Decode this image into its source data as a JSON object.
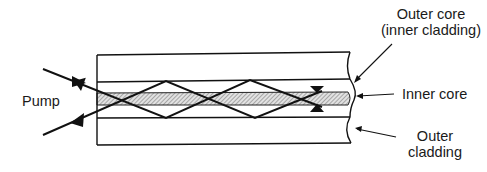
{
  "diagram": {
    "type": "double-clad fiber pumping schematic",
    "labels": {
      "pump": "Pump",
      "outer_core_line1": "Outer core",
      "outer_core_line2": "(inner cladding)",
      "inner_core": "Inner core",
      "outer_cladding_line1": "Outer",
      "outer_cladding_line2": "cladding"
    },
    "colors": {
      "line": "#111111",
      "core_hatch_bg": "#d8d8d8",
      "background": "#ffffff"
    }
  }
}
